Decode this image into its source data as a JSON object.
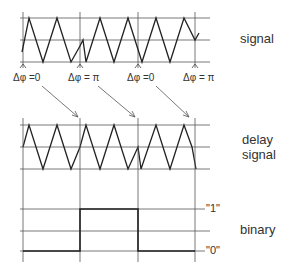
{
  "diagram": {
    "type": "DPSK demodulation timing diagram",
    "panels": [
      {
        "id": "signal",
        "label": "signal"
      },
      {
        "id": "delay",
        "label_lines": [
          "delay",
          "signal"
        ]
      },
      {
        "id": "binary",
        "label": "binary"
      }
    ],
    "phase_markers": [
      {
        "text": "Δφ =0",
        "x": 23
      },
      {
        "text": "Δφ = π",
        "x": 80
      },
      {
        "text": "Δφ =0",
        "x": 138
      },
      {
        "text": "Δφ = π",
        "x": 195
      }
    ],
    "binary_levels": {
      "high": "\"1\"",
      "low": "\"0\""
    },
    "binary_sequence": [
      0,
      1,
      0
    ],
    "colors": {
      "line": "#333333",
      "grid": "#555555",
      "background": "#ffffff"
    }
  },
  "labels": {
    "signal": "signal",
    "delay_line1": "delay",
    "delay_line2": "signal",
    "binary": "binary",
    "one": "\"1\"",
    "zero": "\"0\"",
    "phase0_a": "Δφ =0",
    "phasepi_a": "Δφ = π",
    "phase0_b": "Δφ =0",
    "phasepi_b": "Δφ = π"
  }
}
